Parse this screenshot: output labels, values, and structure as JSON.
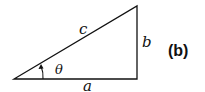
{
  "figure": {
    "panel_label": "(b)",
    "shape": "right-triangle",
    "sides": {
      "hypotenuse": "c",
      "vertical": "b",
      "horizontal": "a"
    },
    "angle": {
      "symbol": "θ",
      "location": "bottom-left vertex, between sides a and c"
    },
    "stroke_color": "#111111",
    "background_color": "#ffffff"
  }
}
